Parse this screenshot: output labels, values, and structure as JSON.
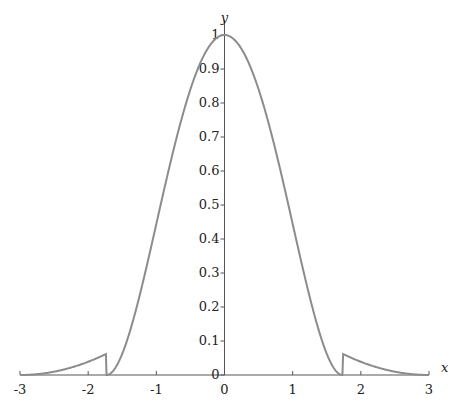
{
  "chart_data": {
    "type": "line",
    "title": "",
    "xlabel": "x",
    "ylabel": "y",
    "xlim": [
      -3,
      3
    ],
    "ylim": [
      0,
      1
    ],
    "grid": false,
    "legend": null,
    "x_ticks": [
      "-3",
      "-2",
      "-1",
      "0",
      "1",
      "2",
      "3"
    ],
    "y_ticks": [
      "0",
      "0.1",
      "0.2",
      "0.3",
      "0.4",
      "0.5",
      "0.6",
      "0.7",
      "0.8",
      "0.9",
      "1"
    ],
    "line_color": "#8c8c8c",
    "series": [
      {
        "name": "y(x)",
        "x": [
          -3,
          -2.5,
          -2,
          -1.732,
          -1.5,
          -1.25,
          -1,
          -0.75,
          -0.5,
          -0.25,
          0,
          0.25,
          0.5,
          0.75,
          1,
          1.25,
          1.5,
          1.732,
          2,
          2.5,
          3
        ],
        "values": [
          0,
          0.01,
          0.039,
          0.0625,
          0.063,
          0.23,
          0.444,
          0.66,
          0.84,
          0.958,
          1,
          0.958,
          0.84,
          0.66,
          0.444,
          0.23,
          0.063,
          0.0625,
          0.039,
          0.01,
          0
        ]
      }
    ],
    "annotations": []
  }
}
